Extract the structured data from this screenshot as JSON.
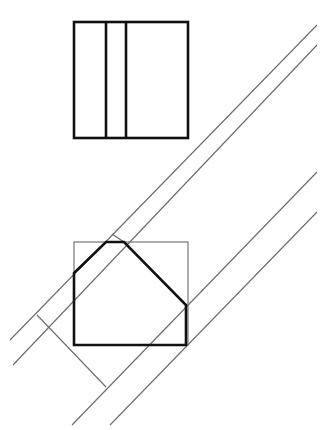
{
  "diagram": {
    "type": "orthographic-auxiliary-view",
    "background": "#ffffff",
    "colors": {
      "thick": "#111111",
      "thin": "#6a6a6a"
    },
    "top_view": {
      "rect": {
        "x": 74,
        "y": 22,
        "w": 114,
        "h": 116
      },
      "dividers_x": [
        106,
        126
      ]
    },
    "front_view": {
      "bounding_square": {
        "x": 74,
        "y": 242,
        "w": 114,
        "h": 103
      },
      "pentagon": [
        [
          74,
          345
        ],
        [
          74,
          273
        ],
        [
          106,
          242
        ],
        [
          124,
          242
        ],
        [
          186,
          305
        ],
        [
          186,
          345
        ]
      ]
    },
    "projection_lines": [
      {
        "name": "upper-line-a",
        "x1": 317,
        "y1": 25,
        "x2": 10,
        "y2": 340
      },
      {
        "name": "upper-line-b",
        "x1": 317,
        "y1": 45,
        "x2": 13,
        "y2": 365
      },
      {
        "name": "lower-line-c",
        "x1": 317,
        "y1": 172,
        "x2": 72,
        "y2": 425
      },
      {
        "name": "lower-line-d",
        "x1": 317,
        "y1": 212,
        "x2": 110,
        "y2": 425
      }
    ],
    "perpendicular": {
      "x1": 37,
      "y1": 315,
      "x2": 106,
      "y2": 387
    },
    "tick": {
      "x1": 112,
      "y1": 234,
      "x2": 124,
      "y2": 242
    }
  }
}
